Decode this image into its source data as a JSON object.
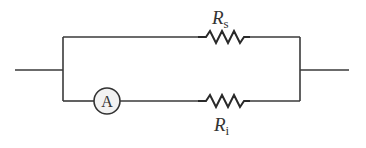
{
  "diagram": {
    "type": "circuit-schematic",
    "colors": {
      "wire": "#3a3a3a",
      "meter_fill": "#f2f2f2"
    },
    "components": {
      "shunt_resistor": {
        "symbol": "R",
        "subscript": "s",
        "branch": "top"
      },
      "ammeter": {
        "symbol": "A",
        "branch": "bottom"
      },
      "internal_resistor": {
        "symbol": "R",
        "subscript": "i",
        "branch": "bottom"
      }
    }
  }
}
